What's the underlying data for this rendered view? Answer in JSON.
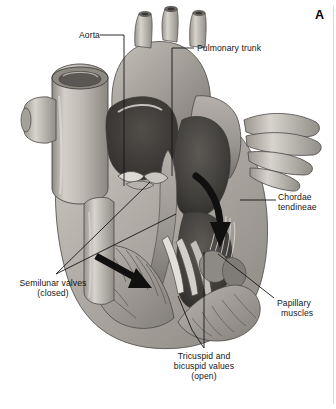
{
  "figure": {
    "panel_letter": "A",
    "background_color": "#ffffff",
    "ink_color": "#151515",
    "style": "grayscale-anatomical-illustration"
  },
  "labels": [
    {
      "id": "aorta",
      "text": "Aorta",
      "align": "right",
      "x": 66,
      "y": 30,
      "leader": "horizontal-then-down-to-vessel"
    },
    {
      "id": "pulmonary-trunk",
      "text": "Pulmonary trunk",
      "align": "left",
      "x": 197,
      "y": 44,
      "leader": "horizontal-then-down-into-trunk"
    },
    {
      "id": "chordae-tendineae",
      "line1": "Chordae",
      "line2": "tendineae",
      "align": "left",
      "x": 278,
      "y": 193,
      "leader": "horizontal-left-to-valve-cords"
    },
    {
      "id": "papillary-muscles",
      "line1": "Papillary",
      "line2": "muscles",
      "align": "left",
      "x": 277,
      "y": 299,
      "leader": "diagonal-up-left-to-ventricle-wall"
    },
    {
      "id": "semilunar-valves",
      "line1": "Semilunar valves",
      "line2": "(closed)",
      "align": "center",
      "x": 6,
      "y": 279,
      "leader": "two-diagonals-up-right"
    },
    {
      "id": "tricuspid-bicuspid-valves",
      "line1": "Tricuspid and",
      "line2": "bicuspid values",
      "line3": "(open)",
      "align": "center",
      "x": 166,
      "y": 352,
      "leader": "two-verticals-up-into-ventricles"
    }
  ],
  "arrows": [
    {
      "id": "right-ventricle-flow-arrow",
      "direction": "down",
      "style": "curved-black"
    },
    {
      "id": "left-ventricle-flow-arrow",
      "direction": "down-right",
      "style": "straight-black"
    }
  ],
  "colors": {
    "paper": "#ffffff",
    "vessel_light": "#cfcbc6",
    "vessel_mid": "#b3aea8",
    "muscle_mid": "#a8a39d",
    "muscle_dark": "#6f6b66",
    "chamber_dark": "#4a4744",
    "chamber_darkest": "#343230",
    "outline": "#3a3836",
    "highlight": "#ece9e5",
    "arrow": "#101010"
  }
}
